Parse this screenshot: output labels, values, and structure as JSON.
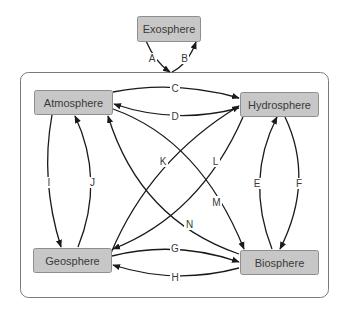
{
  "diagram": {
    "type": "earth-systems-interaction",
    "nodes": {
      "exosphere": {
        "label": "Exosphere"
      },
      "atmosphere": {
        "label": "Atmosphere"
      },
      "hydrosphere": {
        "label": "Hydrosphere"
      },
      "geosphere": {
        "label": "Geosphere"
      },
      "biosphere": {
        "label": "Biosphere"
      }
    },
    "edges": [
      {
        "id": "A",
        "label": "A",
        "from": "Exosphere",
        "to": "Earth system"
      },
      {
        "id": "B",
        "label": "B",
        "from": "Earth system",
        "to": "Exosphere"
      },
      {
        "id": "C",
        "label": "C",
        "from": "Atmosphere",
        "to": "Hydrosphere"
      },
      {
        "id": "D",
        "label": "D",
        "from": "Hydrosphere",
        "to": "Atmosphere"
      },
      {
        "id": "E",
        "label": "E",
        "from": "Biosphere",
        "to": "Hydrosphere"
      },
      {
        "id": "F",
        "label": "F",
        "from": "Hydrosphere",
        "to": "Biosphere"
      },
      {
        "id": "G",
        "label": "G",
        "from": "Geosphere",
        "to": "Biosphere"
      },
      {
        "id": "H",
        "label": "H",
        "from": "Biosphere",
        "to": "Geosphere"
      },
      {
        "id": "I",
        "label": "I",
        "from": "Atmosphere",
        "to": "Geosphere"
      },
      {
        "id": "J",
        "label": "J",
        "from": "Geosphere",
        "to": "Atmosphere"
      },
      {
        "id": "K",
        "label": "K",
        "from": "Geosphere",
        "to": "Hydrosphere"
      },
      {
        "id": "L",
        "label": "L",
        "from": "Hydrosphere",
        "to": "Geosphere"
      },
      {
        "id": "M",
        "label": "M",
        "from": "Atmosphere",
        "to": "Biosphere"
      },
      {
        "id": "N",
        "label": "N",
        "from": "Biosphere",
        "to": "Atmosphere"
      }
    ],
    "colors": {
      "box_fill": "#c7c7c7",
      "box_stroke": "#8e8e8e",
      "arrow": "#1a1a1a",
      "container_stroke": "#7a7a7a"
    }
  }
}
